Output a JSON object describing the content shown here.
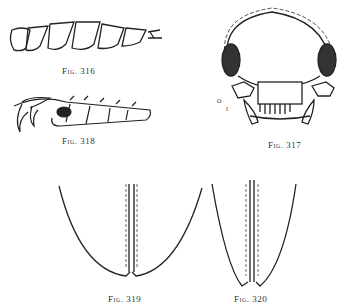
{
  "figures": [
    {
      "id": "fig316",
      "caption": "Fig. 316",
      "subject": "antenna-segments"
    },
    {
      "id": "fig317",
      "caption": "Fig. 317",
      "subject": "head-frontal-view",
      "labels": [
        "o",
        "i"
      ]
    },
    {
      "id": "fig318",
      "caption": "Fig. 318",
      "subject": "tarsus-with-claws"
    },
    {
      "id": "fig319",
      "caption": "Fig. 319",
      "subject": "elytra-apex-rounded"
    },
    {
      "id": "fig320",
      "caption": "Fig. 320",
      "subject": "elytra-apex-pointed"
    }
  ],
  "colors": {
    "ink": "#222222",
    "paper": "#ffffff"
  }
}
